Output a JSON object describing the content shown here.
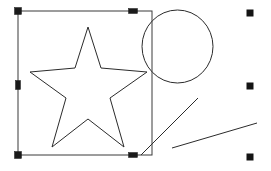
{
  "canvas": {
    "width": 271,
    "height": 171,
    "background_color": "#ffffff",
    "stroke_color": "#2b2b2b",
    "handle_color": "#1a1a1a",
    "selection_frame_color": "#3a3a3a"
  },
  "selection": {
    "frame": {
      "x": 18,
      "y": 11,
      "width": 134,
      "height": 144
    },
    "handles": [
      {
        "name": "handle-top-left",
        "cx": 18,
        "cy": 11,
        "w": 7,
        "h": 7,
        "shape": "square"
      },
      {
        "name": "handle-top-middle",
        "cx": 133,
        "cy": 11,
        "w": 9,
        "h": 5,
        "shape": "bar-horizontal"
      },
      {
        "name": "handle-middle-left",
        "cx": 18,
        "cy": 85,
        "w": 5,
        "h": 9,
        "shape": "bar-vertical"
      },
      {
        "name": "handle-bottom-left",
        "cx": 18,
        "cy": 155,
        "w": 7,
        "h": 7,
        "shape": "square"
      },
      {
        "name": "handle-bottom-middle",
        "cx": 133,
        "cy": 155,
        "w": 9,
        "h": 5,
        "shape": "bar-horizontal"
      }
    ]
  },
  "anchor_markers": [
    {
      "name": "anchor-marker-top-right",
      "cx": 250,
      "cy": 13,
      "size": 7
    },
    {
      "name": "anchor-marker-middle-right",
      "cx": 250,
      "cy": 86,
      "size": 7
    },
    {
      "name": "anchor-marker-bottom-right",
      "cx": 250,
      "cy": 157,
      "size": 7
    }
  ],
  "shapes": {
    "star": {
      "label": "five-pointed-star",
      "points": "88,27 101,68 147,72 110,98 124,147 88,119 52,147 66,98 30,72 75,68"
    },
    "circle": {
      "label": "circle",
      "cx": 177.5,
      "cy": 46.5,
      "rx": 35.5,
      "ry": 36.5
    },
    "lines": [
      {
        "label": "diagonal-line-steep",
        "x1": 141,
        "y1": 155,
        "x2": 198,
        "y2": 98
      },
      {
        "label": "diagonal-line-shallow",
        "x1": 172,
        "y1": 148,
        "x2": 257,
        "y2": 123
      }
    ]
  }
}
